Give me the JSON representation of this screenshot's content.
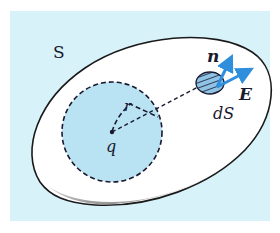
{
  "figure": {
    "labels": {
      "surface": "S",
      "charge": "q",
      "radius": "r",
      "normal": "n",
      "field": "E",
      "area_element": "dS"
    },
    "colors": {
      "background": "#d8f2f9",
      "frame": "#ffffff",
      "surface_fill": "#ffffff",
      "surface_stroke": "#1a1a1a",
      "sphere_fill": "#b9e2f3",
      "patch_fill": "#8fc4e6",
      "arrow": "#2f8fdc",
      "text": "#1a1a2e"
    }
  }
}
